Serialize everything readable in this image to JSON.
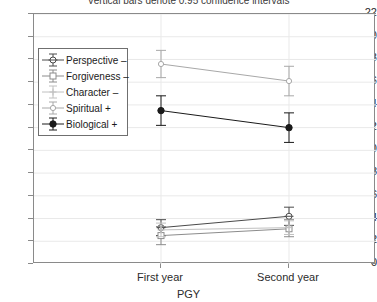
{
  "title": "Vertical bars denote 0.95 confidence intervals",
  "axis": {
    "xlabel": "PGY",
    "ylabel": "",
    "ytick_labels": [
      "0",
      "2",
      "4",
      "6",
      "8",
      "10",
      "12",
      "14",
      "16",
      "18",
      "20",
      "22"
    ],
    "xtick_labels": [
      "First year",
      "Second year"
    ]
  },
  "chart_data": {
    "type": "line",
    "title": "Vertical bars denote 0.95 confidence intervals",
    "xlabel": "PGY",
    "ylabel": "",
    "categories": [
      "First year",
      "Second year"
    ],
    "ylim": [
      0,
      22
    ],
    "ytick_step": 2,
    "grid": true,
    "legend_position": "upper-left-inside",
    "error_bar_note": "Vertical bars denote 0.95 confidence intervals",
    "series": [
      {
        "name": "Perspective –",
        "marker": "circle-crosshair",
        "color": "#4a4a4a",
        "values": [
          3.2,
          4.2
        ],
        "ci_lower": [
          2.5,
          3.4
        ],
        "ci_upper": [
          3.9,
          5.0
        ]
      },
      {
        "name": "Forgiveness –",
        "marker": "open-square",
        "color": "#8c8c8c",
        "values": [
          2.5,
          3.1
        ],
        "ci_lower": [
          1.7,
          2.4
        ],
        "ci_upper": [
          3.3,
          3.9
        ]
      },
      {
        "name": "Character –",
        "marker": "plus",
        "color": "#c0c0c0",
        "values": [
          3.0,
          3.2
        ],
        "ci_lower": [
          2.4,
          2.6
        ],
        "ci_upper": [
          3.6,
          3.8
        ]
      },
      {
        "name": "Spiritual +",
        "marker": "small-circle",
        "color": "#a8a8a8",
        "values": [
          17.6,
          16.1
        ],
        "ci_lower": [
          16.4,
          14.8
        ],
        "ci_upper": [
          18.8,
          17.4
        ]
      },
      {
        "name": "Biological +",
        "marker": "filled-circle",
        "color": "#1a1a1a",
        "values": [
          13.5,
          12.0
        ],
        "ci_lower": [
          12.2,
          10.7
        ],
        "ci_upper": [
          14.8,
          13.3
        ]
      }
    ]
  }
}
